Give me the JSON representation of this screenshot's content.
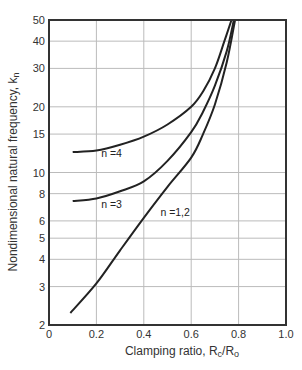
{
  "chart_data": {
    "type": "line",
    "title": "",
    "xlabel": "Clamping ratio, R",
    "xlabel_sub": "c",
    "xlabel_mid": "/R",
    "xlabel_sub2": "o",
    "ylabel": "Nondimensional natural frequency, k",
    "ylabel_sub": "n",
    "xlim": [
      0,
      1.0
    ],
    "ylim": [
      2,
      50
    ],
    "yscale": "log",
    "grid": true,
    "x_ticks": [
      "0",
      "0.2",
      "0.4",
      "0.6",
      "0.8",
      "1.0"
    ],
    "y_ticks": [
      "2",
      "3",
      "4",
      "5",
      "6",
      "8",
      "10",
      "15",
      "20",
      "30",
      "40",
      "50"
    ],
    "series": [
      {
        "name": "n =4",
        "x": [
          0.1,
          0.2,
          0.3,
          0.4,
          0.5,
          0.6,
          0.65,
          0.7,
          0.74,
          0.77
        ],
        "y": [
          12.4,
          12.6,
          13.4,
          14.6,
          16.6,
          20.0,
          23.5,
          30.0,
          40.0,
          50.0
        ]
      },
      {
        "name": "n =3",
        "x": [
          0.1,
          0.2,
          0.3,
          0.4,
          0.5,
          0.6,
          0.65,
          0.7,
          0.75,
          0.78
        ],
        "y": [
          7.4,
          7.6,
          8.2,
          9.1,
          11.3,
          15.3,
          19.0,
          25.0,
          36.0,
          50.0
        ]
      },
      {
        "name": "n =1,2",
        "x": [
          0.09,
          0.2,
          0.3,
          0.4,
          0.5,
          0.6,
          0.65,
          0.7,
          0.75,
          0.785
        ],
        "y": [
          2.27,
          3.1,
          4.4,
          6.2,
          8.6,
          11.7,
          15.0,
          20.5,
          32.0,
          50.0
        ]
      }
    ],
    "labels": [
      {
        "text": "n =4",
        "x": 0.22,
        "y": 12.3
      },
      {
        "text": "n =3",
        "x": 0.22,
        "y": 7.2
      },
      {
        "text": "n =1,2",
        "x": 0.47,
        "y": 6.6
      }
    ]
  }
}
